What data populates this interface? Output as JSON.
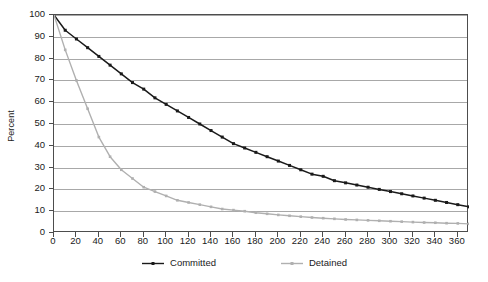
{
  "chart_data": {
    "type": "line",
    "title": "",
    "xlabel": "",
    "ylabel": "Percent",
    "xlim": [
      0,
      370
    ],
    "ylim": [
      0,
      100
    ],
    "xticks": [
      0,
      20,
      40,
      60,
      80,
      100,
      120,
      140,
      160,
      180,
      200,
      220,
      240,
      260,
      280,
      300,
      320,
      340,
      360
    ],
    "yticks": [
      0,
      10,
      20,
      30,
      40,
      50,
      60,
      70,
      80,
      90,
      100
    ],
    "grid": "horizontal",
    "legend_position": "bottom-center",
    "x": [
      0,
      10,
      20,
      30,
      40,
      50,
      60,
      70,
      80,
      90,
      100,
      110,
      120,
      130,
      140,
      150,
      160,
      170,
      180,
      190,
      200,
      210,
      220,
      230,
      240,
      250,
      260,
      270,
      280,
      290,
      300,
      310,
      320,
      330,
      340,
      350,
      360,
      370
    ],
    "series": [
      {
        "name": "Committed",
        "color": "#1a1a1a",
        "marker": "square",
        "values": [
          100,
          93,
          89,
          85,
          81,
          77,
          73,
          69,
          66,
          62,
          59,
          56,
          53,
          50,
          47,
          44,
          41,
          39,
          37,
          35,
          33,
          31,
          29,
          27,
          26,
          24,
          23,
          22,
          21,
          20,
          19,
          18,
          17,
          16,
          15,
          14,
          13,
          12
        ]
      },
      {
        "name": "Detained",
        "color": "#b0b0b0",
        "marker": "square",
        "values": [
          100,
          84,
          70,
          57,
          44,
          35,
          29,
          25,
          21,
          19,
          17,
          15,
          14,
          13,
          12,
          11,
          10.5,
          10,
          9.3,
          8.8,
          8.3,
          7.9,
          7.5,
          7.1,
          6.8,
          6.5,
          6.2,
          6.0,
          5.8,
          5.6,
          5.4,
          5.2,
          5.0,
          4.8,
          4.7,
          4.5,
          4.4,
          4.2
        ]
      }
    ]
  },
  "legend": {
    "items": [
      {
        "label": "Committed"
      },
      {
        "label": "Detained"
      }
    ]
  }
}
